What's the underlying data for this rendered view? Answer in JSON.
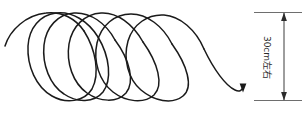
{
  "figure": {
    "background_color": "#ffffff",
    "stroke_color": "#1a1a1a",
    "dimension_color": "#3c3c3c",
    "extension_color": "#6e6e6e"
  },
  "dimension": {
    "label": "30cm左右",
    "value": "30",
    "unit": "cm",
    "qualifier": "左右",
    "orientation": "vertical",
    "top_y": 12,
    "bottom_y": 100,
    "line_x": 284,
    "extension_left_x": 254,
    "extension_right_x": 302,
    "arrow_top": "down-arrow-icon",
    "arrow_bottom": "up-arrow-icon"
  },
  "coil": {
    "description": "spring-helix",
    "turns": 4,
    "start_point": [
      5,
      46
    ],
    "end_point": [
      243,
      90
    ],
    "end_arrow": "down-arrow-icon",
    "top_y": 13,
    "bottom_y": 102,
    "loop_centers_x": [
      62,
      110,
      158,
      206
    ],
    "loop_rx": 40,
    "loop_ry": 44
  }
}
